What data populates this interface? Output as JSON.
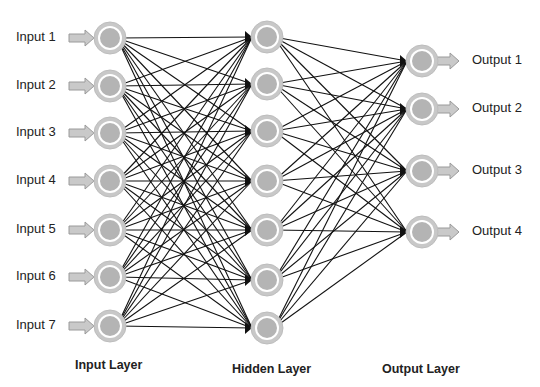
{
  "diagram": {
    "type": "feedforward-neural-network",
    "colors": {
      "node_ring": "#c8c8c8",
      "node_ring_stroke": "#bdbdbd",
      "node_gap": "#ffffff",
      "node_core": "#b4b4b4",
      "edge": "#111111",
      "arrow_fill": "#c9c9c9",
      "arrow_stroke": "#9a9a9a",
      "text": "#222222"
    },
    "layers": {
      "input": {
        "label": "Input Layer",
        "x": 110,
        "nodes": [
          {
            "label": "Input 1",
            "y": 38
          },
          {
            "label": "Input 2",
            "y": 86
          },
          {
            "label": "Input 3",
            "y": 133
          },
          {
            "label": "Input 4",
            "y": 181
          },
          {
            "label": "Input 5",
            "y": 230
          },
          {
            "label": "Input 6",
            "y": 277
          },
          {
            "label": "Input 7",
            "y": 326
          }
        ]
      },
      "hidden": {
        "label": "Hidden Layer",
        "x": 267,
        "nodes": [
          {
            "y": 37
          },
          {
            "y": 84
          },
          {
            "y": 131
          },
          {
            "y": 181
          },
          {
            "y": 230
          },
          {
            "y": 280
          },
          {
            "y": 328
          }
        ]
      },
      "output": {
        "label": "Output Layer",
        "x": 422,
        "nodes": [
          {
            "label": "Output 1",
            "y": 61
          },
          {
            "label": "Output 2",
            "y": 109
          },
          {
            "label": "Output 3",
            "y": 171
          },
          {
            "label": "Output 4",
            "y": 232
          }
        ]
      }
    }
  }
}
